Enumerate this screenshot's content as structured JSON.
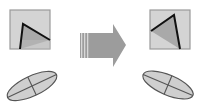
{
  "diagram": {
    "colors": {
      "background": "#ffffff",
      "square_fill": "#d4d4d4",
      "square_border": "#9a9a9a",
      "triangle_fill": "#a9a9a9",
      "triangle_light": "#bcbcbc",
      "line": "#111111",
      "arrow_fill": "#9c9c9c",
      "arrow_stripe": "#d8d8d8",
      "ellipse_fill": "#cfcfcf",
      "ellipse_stroke": "#555555"
    },
    "before": {
      "square": {
        "x": 10,
        "y": 10,
        "w": 40,
        "h": 39
      },
      "triangle": [
        [
          23,
          24
        ],
        [
          50,
          40
        ],
        [
          20,
          49
        ]
      ],
      "ellipse": {
        "cx": 32,
        "cy": 86,
        "rx": 27,
        "ry": 10,
        "rotation": -25
      }
    },
    "after": {
      "square": {
        "x": 150,
        "y": 10,
        "w": 40,
        "h": 39
      },
      "triangle": [
        [
          174,
          15
        ],
        [
          151,
          31
        ],
        [
          180,
          49
        ]
      ],
      "ellipse": {
        "cx": 168,
        "cy": 85,
        "rx": 27,
        "ry": 10,
        "rotation": 23
      }
    },
    "arrow": {
      "direction": "right",
      "icon": "right-arrow-icon"
    }
  }
}
